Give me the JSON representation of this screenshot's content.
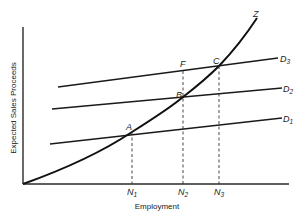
{
  "diagram": {
    "axes": {
      "ylabel": "Expected Sales Proceeds",
      "xlabel": "Employment"
    },
    "curve": {
      "label": "Z"
    },
    "demand_lines": [
      {
        "label": "D",
        "sub": "1"
      },
      {
        "label": "D",
        "sub": "2"
      },
      {
        "label": "D",
        "sub": "3"
      }
    ],
    "points": {
      "A": "A",
      "B": "B",
      "C": "C",
      "F": "F"
    },
    "ticks": [
      {
        "label": "N",
        "sub": "1"
      },
      {
        "label": "N",
        "sub": "2"
      },
      {
        "label": "N",
        "sub": "3"
      }
    ]
  }
}
